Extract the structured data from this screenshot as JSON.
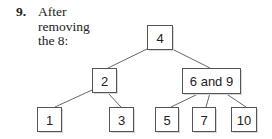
{
  "caption": {
    "number": "9.",
    "text_lines": [
      "After",
      "removing",
      "the 8:"
    ]
  },
  "tree": {
    "nodes": [
      {
        "id": "n4",
        "label": "4",
        "x": 147,
        "y": 25,
        "w": 25,
        "h": 24
      },
      {
        "id": "n2",
        "label": "2",
        "x": 92,
        "y": 68,
        "w": 24,
        "h": 24
      },
      {
        "id": "n69",
        "label": "6 and 9",
        "x": 182,
        "y": 68,
        "w": 58,
        "h": 25
      },
      {
        "id": "n1",
        "label": "1",
        "x": 37,
        "y": 107,
        "w": 24,
        "h": 24
      },
      {
        "id": "n3",
        "label": "3",
        "x": 109,
        "y": 107,
        "w": 24,
        "h": 24
      },
      {
        "id": "n5",
        "label": "5",
        "x": 155,
        "y": 107,
        "w": 23,
        "h": 24
      },
      {
        "id": "n7",
        "label": "7",
        "x": 192,
        "y": 107,
        "w": 23,
        "h": 24
      },
      {
        "id": "n10",
        "label": "10",
        "x": 231,
        "y": 107,
        "w": 25,
        "h": 24
      }
    ],
    "edges": [
      {
        "from": "4",
        "to": "2",
        "x1": 147,
        "y1": 49,
        "x2": 108,
        "y2": 68
      },
      {
        "from": "4",
        "to": "6 and 9",
        "x1": 172,
        "y1": 49,
        "x2": 210,
        "y2": 68
      },
      {
        "from": "2",
        "to": "1",
        "x1": 92,
        "y1": 90,
        "x2": 55,
        "y2": 107
      },
      {
        "from": "2",
        "to": "3",
        "x1": 107,
        "y1": 92,
        "x2": 121,
        "y2": 107
      },
      {
        "from": "6 and 9",
        "to": "5",
        "x1": 200,
        "y1": 93,
        "x2": 171,
        "y2": 107
      },
      {
        "from": "6 and 9",
        "to": "7",
        "x1": 210,
        "y1": 93,
        "x2": 206,
        "y2": 107
      },
      {
        "from": "6 and 9",
        "to": "10",
        "x1": 225,
        "y1": 93,
        "x2": 246,
        "y2": 107
      }
    ]
  }
}
